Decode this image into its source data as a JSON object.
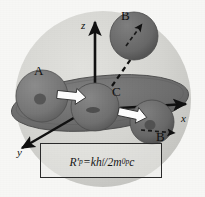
{
  "figure": {
    "background_color": "#f7f7f5",
    "outer_sphere": {
      "name": "outer-shell-sphere",
      "fill": "#d3d3cf",
      "cx": 103,
      "cy": 99,
      "r": 88
    },
    "disc": {
      "name": "equatorial-disc",
      "fill": "#6e6e6e",
      "cx": 100,
      "cy": 103,
      "rx": 89,
      "ry": 27,
      "rotation_deg": -6
    },
    "axes": [
      {
        "id": "z",
        "label": "z",
        "label_x": 81,
        "label_y": 26,
        "direction": "up"
      },
      {
        "id": "x",
        "label": "x",
        "label_x": 182,
        "label_y": 120,
        "direction": "right"
      },
      {
        "id": "y",
        "label": "y",
        "label_x": 18,
        "label_y": 152,
        "direction": "down-left"
      }
    ],
    "spheres": [
      {
        "id": "A",
        "label": "A",
        "label_x": 34,
        "label_y": 71,
        "cx": 42,
        "cy": 96,
        "r": 26,
        "fill": "#7a7a7a"
      },
      {
        "id": "C",
        "label": "C",
        "label_x": 112,
        "label_y": 92,
        "cx": 95,
        "cy": 107,
        "r": 24,
        "fill": "#757575"
      },
      {
        "id": "B-lower",
        "label": "B",
        "label_x": 158,
        "label_y": 137,
        "cx": 152,
        "cy": 122,
        "r": 22,
        "fill": "#6a6a6a"
      },
      {
        "id": "B-upper",
        "label": "B",
        "label_x": 124,
        "label_y": 18,
        "cx": 134,
        "cy": 36,
        "r": 24,
        "fill": "#707070"
      }
    ],
    "momentum_arrows": [
      {
        "id": "arrow-A-to-C",
        "note": "white block arrow pointing right"
      },
      {
        "id": "arrow-C-to-B",
        "note": "white block arrow pointing down-right"
      }
    ],
    "dashed_paths": [
      {
        "id": "dashed-C-to-B-upper",
        "note": "dashed trajectory from center C to detached upper sphere B"
      },
      {
        "id": "dashed-arrow-B-lower",
        "note": "short dashed arrow at lower B pointing right"
      },
      {
        "id": "dashed-arrow-B-upper",
        "note": "short dashed arrow inside upper B pointing up-right"
      }
    ],
    "formula": {
      "name": "recoil-radius-formula",
      "lhs": "R'",
      "lhs_sub": "p",
      "equals": "=",
      "numerator": "kh",
      "numerator_sub": "f",
      "slash": "/",
      "denominator_coeff": "2m",
      "denominator_sub": "0p",
      "denominator_tail": "c",
      "plain_text": "R'p = khf / 2m0p c"
    }
  }
}
